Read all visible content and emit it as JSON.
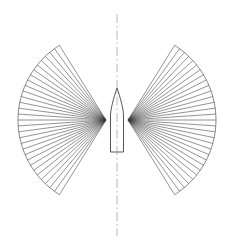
{
  "figure": {
    "background_color": "#ffffff",
    "width": 231,
    "height": 250,
    "caption": ""
  },
  "colors": {
    "ray_stroke": "#3a3a3a",
    "arc_stroke": "#3a3a3a",
    "hull_stroke": "#2b2b2b",
    "hull_fill": "#ffffff",
    "centerline_stroke": "#9a9a9a",
    "background": "#ffffff"
  },
  "centerline": {
    "label": "vessel-centerline",
    "x": 117,
    "y_top": 14,
    "y_bottom": 236,
    "style": "dash-dot",
    "dash_pattern": "9 3 1.5 3",
    "width": 0.7
  },
  "hull": {
    "label": "vessel-hull",
    "center_x": 117,
    "bow_y": 88,
    "stern_y": 152,
    "shoulder_y": 116,
    "half_beam": 6.5,
    "bow_half_beam": 0.6,
    "outline_points": "117,88 119.2,97 120.6,106 121.2,116 121.2,152 112.8,152 112.8,116 113.4,106 114.8,97"
  },
  "fans": [
    {
      "label": "port-swath-fan",
      "side": "port",
      "apex_x": 106,
      "apex_y": 120,
      "direction": -1,
      "radius": 88,
      "angle_start_deg": -58,
      "angle_end_deg": 58,
      "ray_count": 31,
      "outer_arc": true
    },
    {
      "label": "starboard-swath-fan",
      "side": "starboard",
      "apex_x": 128,
      "apex_y": 120,
      "direction": 1,
      "radius": 88,
      "angle_start_deg": -58,
      "angle_end_deg": 58,
      "ray_count": 31,
      "outer_arc": true
    }
  ]
}
